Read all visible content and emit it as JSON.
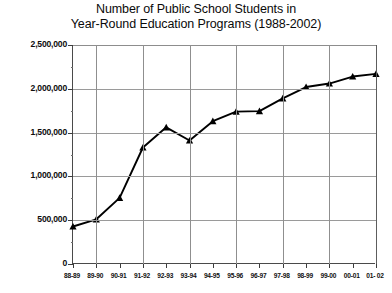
{
  "chart_data": {
    "type": "line",
    "title": "Number of Public School Students in Year-Round Education Programs (1988-2002)",
    "title_lines": [
      "Number of Public School Students in",
      "Year-Round Education Programs (1988-2002)"
    ],
    "xlabel": "",
    "ylabel": "",
    "categories": [
      "88-89",
      "89-90",
      "90-91",
      "91-92",
      "92-93",
      "93-94",
      "94-95",
      "95-96",
      "96-97",
      "97-98",
      "98-99",
      "99-00",
      "00-01",
      "01- 02"
    ],
    "values": [
      428000,
      510000,
      755000,
      1330000,
      1560000,
      1410000,
      1630000,
      1740000,
      1745000,
      1890000,
      2020000,
      2060000,
      2140000,
      2170000
    ],
    "ylim": [
      0,
      2500000
    ],
    "ytick_values": [
      0,
      500000,
      1000000,
      1500000,
      2000000,
      2500000
    ],
    "ytick_labels": [
      "0",
      "500,000",
      "1,000,000",
      "1,500,000",
      "2,000,000",
      "2,500,000"
    ],
    "grid": "horizontal-and-vertical",
    "legend": "none",
    "marker": "triangle",
    "line_color": "#000000",
    "marker_color": "#000000",
    "grid_color": "#9a9a9a",
    "axis_color": "#3c3c3c",
    "background": "#ffffff"
  }
}
